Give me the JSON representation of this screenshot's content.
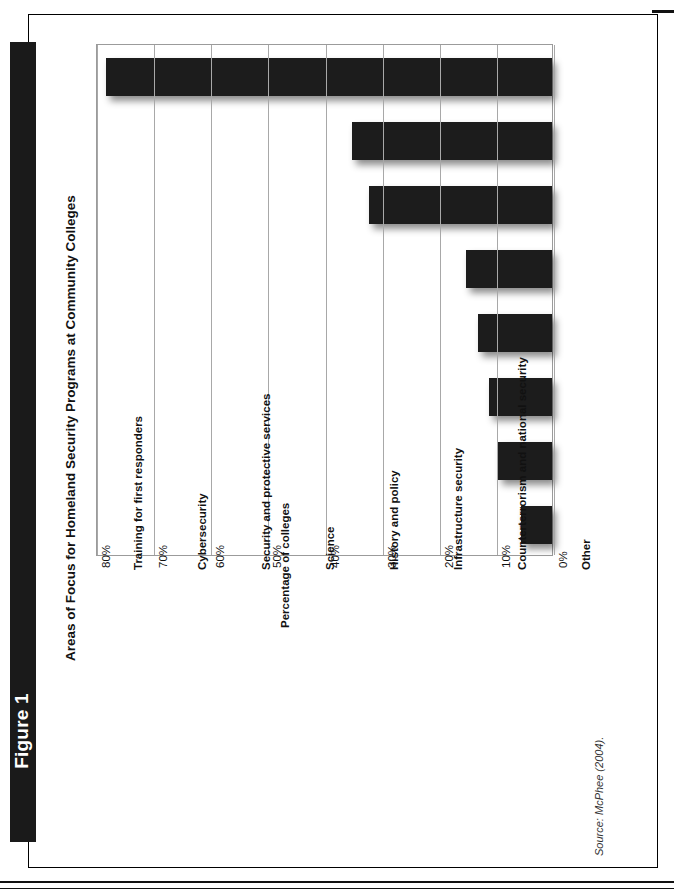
{
  "figure": {
    "band_label": "Figure 1",
    "title": "Areas of Focus for Homeland Security Programs at Community Colleges",
    "source_note": "Source: McPhee (2004)."
  },
  "chart_data": {
    "type": "bar",
    "orientation": "vertical-printed-sideways",
    "title": "Areas of Focus for Homeland Security Programs at Community Colleges",
    "categories": [
      "Training for first responders",
      "Cybersecurity",
      "Security and protective services",
      "Science",
      "History and policy",
      "Infrastructure security",
      "Counterterrorism and national security",
      "Other"
    ],
    "values": [
      78,
      35,
      32,
      15,
      13,
      11,
      9.5,
      5.5
    ],
    "xlabel": "",
    "ylabel": "Percentage of colleges",
    "ylim": [
      0,
      80
    ],
    "ytick_labels": [
      "0%",
      "10%",
      "20%",
      "30%",
      "40%",
      "50%",
      "60%",
      "70%",
      "80%"
    ],
    "ytick_values": [
      0,
      10,
      20,
      30,
      40,
      50,
      60,
      70,
      80
    ],
    "grid": true,
    "legend": null,
    "bar_color": "#1c1c1c"
  }
}
